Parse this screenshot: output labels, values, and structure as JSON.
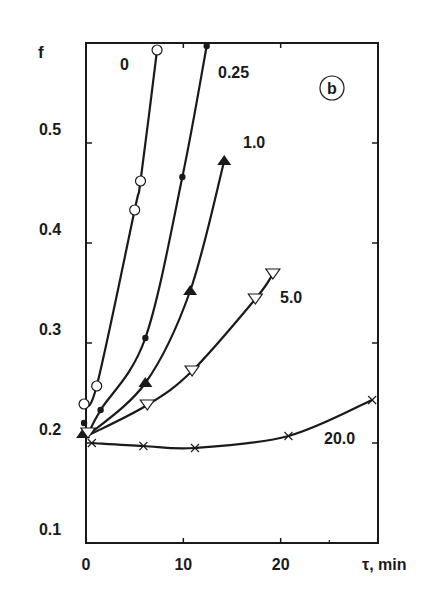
{
  "chart_data": {
    "type": "line",
    "title": "",
    "panel_label": "b",
    "xlabel": "τ, min",
    "ylabel": "f",
    "xlim": [
      0,
      30
    ],
    "ylim": [
      0.1,
      0.6
    ],
    "xticks": [
      0,
      10,
      20
    ],
    "yticks": [
      0.1,
      0.2,
      0.3,
      0.4,
      0.5
    ],
    "xtick_labels": [
      "0",
      "10",
      "20"
    ],
    "ytick_labels": [
      "0.1",
      "0.2",
      "0.3",
      "0.4",
      "0.5"
    ],
    "grid": false,
    "legend": "curve labels placed next to each line",
    "series": [
      {
        "name": "0",
        "marker": "open-circle",
        "x": [
          -0.2,
          1.1,
          5.0,
          5.6,
          7.3
        ],
        "y": [
          0.239,
          0.257,
          0.433,
          0.462,
          0.593
        ]
      },
      {
        "name": "0.25",
        "marker": "filled-circle",
        "x": [
          -0.2,
          1.5,
          6.1,
          9.9,
          12.4
        ],
        "y": [
          0.22,
          0.233,
          0.305,
          0.466,
          0.597
        ]
      },
      {
        "name": "1.0",
        "marker": "filled-triangle-up",
        "x": [
          -0.3,
          6.1,
          10.7,
          14.2
        ],
        "y": [
          0.209,
          0.26,
          0.352,
          0.482
        ]
      },
      {
        "name": "5.0",
        "marker": "open-triangle-down",
        "x": [
          0.2,
          6.3,
          10.9,
          17.4,
          19.2
        ],
        "y": [
          0.21,
          0.238,
          0.272,
          0.344,
          0.369
        ]
      },
      {
        "name": "20.0",
        "marker": "x",
        "x": [
          0.6,
          5.9,
          11.2,
          20.8,
          29.4
        ],
        "y": [
          0.2,
          0.197,
          0.195,
          0.207,
          0.243
        ]
      }
    ],
    "curve_labels": [
      {
        "text": "0",
        "x": 120,
        "y": 70
      },
      {
        "text": "0.25",
        "x": 218,
        "y": 78
      },
      {
        "text": "1.0",
        "x": 243,
        "y": 148
      },
      {
        "text": "5.0",
        "x": 280,
        "y": 303
      },
      {
        "text": "20.0",
        "x": 324,
        "y": 444
      }
    ]
  },
  "colors": {
    "ink": "#1a1a1a",
    "background": "#ffffff"
  }
}
